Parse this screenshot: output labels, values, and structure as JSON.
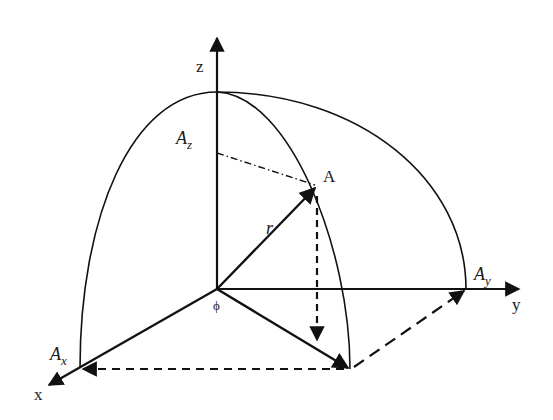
{
  "diagram": {
    "type": "3d-coordinate-vector-diagram",
    "labels": {
      "z_axis": "z",
      "y_axis": "y",
      "x_axis": "x",
      "point": "A",
      "radius": "r",
      "angle": "ϕ",
      "Az_main": "A",
      "Az_sub": "z",
      "Ay_main": "A",
      "Ay_sub": "y",
      "Ax_main": "A",
      "Ax_sub": "x"
    },
    "colors": {
      "stroke": "#111111",
      "background": "#ffffff"
    },
    "points": {
      "origin": [
        217,
        289
      ],
      "z_tip": [
        217,
        36
      ],
      "sphere_top": [
        217,
        92
      ],
      "y_tip": [
        521,
        289
      ],
      "x_tip": [
        47,
        386
      ],
      "A": [
        317,
        186
      ],
      "foot": [
        350,
        369
      ],
      "Ax": [
        80,
        368
      ],
      "Ay": [
        466,
        289
      ],
      "Az": [
        217,
        153
      ]
    }
  }
}
